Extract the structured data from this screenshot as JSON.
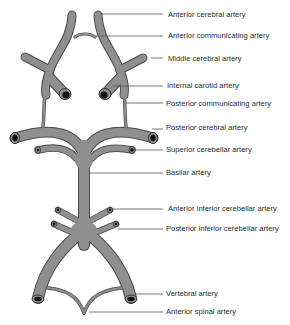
{
  "figure": {
    "colors": {
      "vessel_fill": "#8f8f8f",
      "vessel_outline": "#4a4a4a",
      "lumen": "#111111",
      "leader_line": "#555555",
      "text": "#2a2a2a"
    },
    "labels": [
      {
        "id": "anterior-cerebral-artery",
        "text": "Anterior cerebral artery"
      },
      {
        "id": "anterior-communicating-artery",
        "text": "Anterior communicating artery"
      },
      {
        "id": "middle-cerebral-artery",
        "text": "Middle cerebral artery"
      },
      {
        "id": "internal-carotid-artery",
        "text": "Internal carotid artery"
      },
      {
        "id": "posterior-communicating-artery",
        "text": "Posterior communicating artery"
      },
      {
        "id": "posterior-cerebral-artery",
        "text": "Posterior cerebral artery"
      },
      {
        "id": "superior-cerebellar-artery",
        "text": "Superior cerebellar artery"
      },
      {
        "id": "basilar-artery",
        "text": "Basilar artery"
      },
      {
        "id": "anterior-inferior-cerebellar-artery",
        "text": "Anterior inferior cerebellar artery"
      },
      {
        "id": "posterior-inferior-cerebellar-artery",
        "text": "Posterior inferior cerebellar artery"
      },
      {
        "id": "vertebral-artery",
        "text": "Vertebral artery"
      },
      {
        "id": "anterior-spinal-artery",
        "text": "Anterior spinal artery"
      }
    ]
  }
}
